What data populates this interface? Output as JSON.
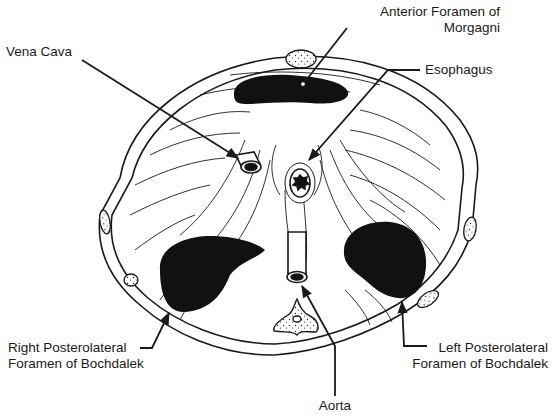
{
  "figure": {
    "colors": {
      "ink": "#1a1a1a",
      "background": "#ffffff",
      "stipple": "#ffffff"
    },
    "structures": [
      {
        "id": "anterior-foramen-of-morgagni",
        "lines": [
          "Anterior Foramen of",
          "Morgagni"
        ]
      },
      {
        "id": "vena-cava",
        "lines": [
          "Vena Cava"
        ]
      },
      {
        "id": "esophagus",
        "lines": [
          "Esophagus"
        ]
      },
      {
        "id": "right-posterolateral-foramen-of-bochdalek",
        "lines": [
          "Right Posterolateral",
          "Foramen of Bochdalek"
        ]
      },
      {
        "id": "left-posterolateral-foramen-of-bochdalek",
        "lines": [
          "Left Posterolateral",
          "Foramen of Bochdalek"
        ]
      },
      {
        "id": "aorta",
        "lines": [
          "Aorta"
        ]
      }
    ]
  }
}
